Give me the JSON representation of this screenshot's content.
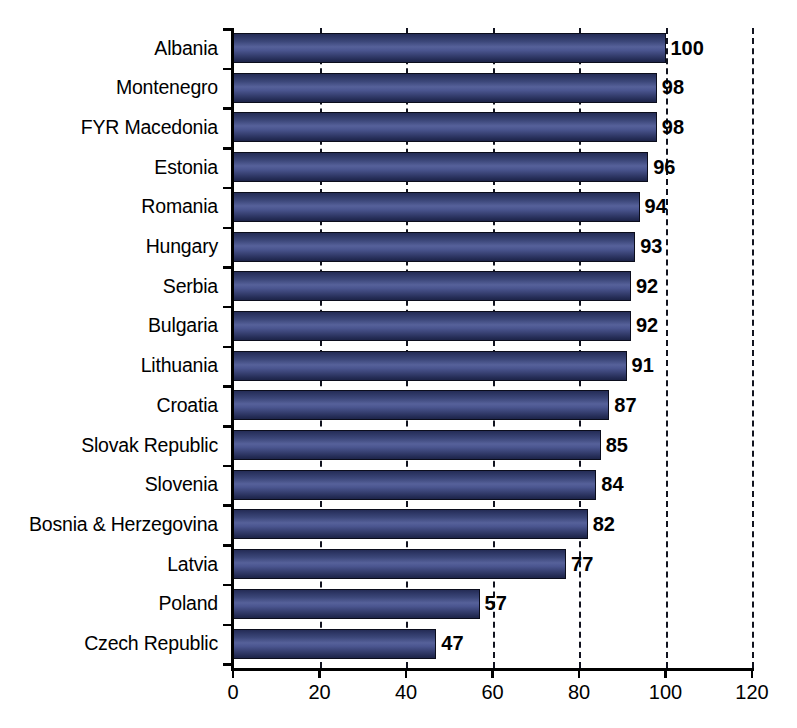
{
  "chart_data": {
    "type": "bar",
    "orientation": "horizontal",
    "title": "",
    "xlabel": "",
    "ylabel": "",
    "xlim": [
      0,
      120
    ],
    "xticks": [
      0,
      20,
      40,
      60,
      80,
      100,
      120
    ],
    "xtick_labels": [
      "0",
      "20",
      "40",
      "60",
      "80",
      "100",
      "120"
    ],
    "grid": "vertical-dashed",
    "legend": "none",
    "categories": [
      "Albania",
      "Montenegro",
      "FYR Macedonia",
      "Estonia",
      "Romania",
      "Hungary",
      "Serbia",
      "Bulgaria",
      "Lithuania",
      "Croatia",
      "Slovak Republic",
      "Slovenia",
      "Bosnia & Herzegovina",
      "Latvia",
      "Poland",
      "Czech Republic"
    ],
    "values": [
      100,
      98,
      98,
      96,
      94,
      93,
      92,
      92,
      91,
      87,
      85,
      84,
      82,
      77,
      57,
      47
    ],
    "value_labels": [
      "100",
      "98",
      "98",
      "96",
      "94",
      "93",
      "92",
      "92",
      "91",
      "87",
      "85",
      "84",
      "82",
      "77",
      "57",
      "47"
    ],
    "bar_color": "#3b4678",
    "bar_border_color": "#0b0d1c",
    "gridline_color": "#11131f",
    "axis_color": "#000000"
  },
  "footer": {
    "partial_caption": ""
  }
}
